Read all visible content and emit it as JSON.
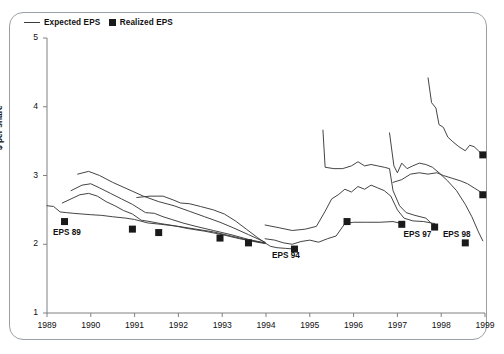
{
  "legend": {
    "items": [
      {
        "label": "Expected EPS",
        "marker": "line"
      },
      {
        "label": "Realized EPS",
        "marker": "square"
      }
    ]
  },
  "chart_data": {
    "type": "line",
    "title": "",
    "xlabel": "",
    "ylabel": "$ per share",
    "xlim": [
      1989,
      1999
    ],
    "ylim": [
      1,
      5
    ],
    "yticks": [
      1,
      2,
      3,
      4,
      5
    ],
    "xticks": [
      1989,
      1990,
      1991,
      1992,
      1993,
      1994,
      1995,
      1996,
      1997,
      1998,
      1999
    ],
    "grid": false,
    "legend_position": "top-left",
    "line_color": "#3a3a3a",
    "marker_color": "#1a1a1a",
    "axis_color": "#808080",
    "annotations": [
      {
        "text": "EPS 89",
        "x": 1989.55,
        "y": 2.15
      },
      {
        "text": "EPS 94",
        "x": 1994.55,
        "y": 1.82
      },
      {
        "text": "EPS 97",
        "x": 1997.55,
        "y": 2.12
      },
      {
        "text": "EPS 98",
        "x": 1998.45,
        "y": 2.12
      }
    ],
    "realized": [
      {
        "name": "EPS 89",
        "x": 1989.4,
        "y": 2.33
      },
      {
        "name": "EPS 90",
        "x": 1990.95,
        "y": 2.22
      },
      {
        "name": "EPS 91",
        "x": 1991.55,
        "y": 2.17
      },
      {
        "name": "EPS 92",
        "x": 1992.95,
        "y": 2.09
      },
      {
        "name": "EPS 93",
        "x": 1993.6,
        "y": 2.02
      },
      {
        "name": "EPS 94",
        "x": 1994.65,
        "y": 1.93
      },
      {
        "name": "EPS 95",
        "x": 1995.85,
        "y": 2.33
      },
      {
        "name": "EPS 96",
        "x": 1997.1,
        "y": 2.29
      },
      {
        "name": "EPS 97",
        "x": 1997.85,
        "y": 2.25
      },
      {
        "name": "EPS 98",
        "x": 1998.55,
        "y": 2.02
      },
      {
        "name": "EPS 99a",
        "x": 1998.95,
        "y": 3.3
      },
      {
        "name": "EPS 99b",
        "x": 1998.95,
        "y": 2.72
      }
    ],
    "series": [
      {
        "name": "Forecast 1989",
        "points": [
          [
            1989.0,
            2.56
          ],
          [
            1989.15,
            2.55
          ],
          [
            1989.3,
            2.47
          ],
          [
            1989.45,
            2.46
          ],
          [
            1989.6,
            2.45
          ],
          [
            1989.8,
            2.44
          ],
          [
            1990.0,
            2.43
          ],
          [
            1990.25,
            2.42
          ],
          [
            1990.5,
            2.4
          ],
          [
            1990.8,
            2.38
          ],
          [
            1991.0,
            2.36
          ],
          [
            1991.3,
            2.31
          ],
          [
            1991.6,
            2.29
          ],
          [
            1992.0,
            2.26
          ],
          [
            1992.4,
            2.22
          ],
          [
            1992.8,
            2.18
          ],
          [
            1993.2,
            2.12
          ],
          [
            1993.6,
            2.06
          ],
          [
            1993.95,
            2.02
          ]
        ]
      },
      {
        "name": "Forecast 1990",
        "points": [
          [
            1989.35,
            2.6
          ],
          [
            1989.55,
            2.66
          ],
          [
            1989.75,
            2.72
          ],
          [
            1989.95,
            2.74
          ],
          [
            1990.15,
            2.7
          ],
          [
            1990.35,
            2.62
          ],
          [
            1990.55,
            2.56
          ],
          [
            1990.75,
            2.49
          ],
          [
            1990.95,
            2.44
          ],
          [
            1991.15,
            2.35
          ],
          [
            1991.35,
            2.33
          ],
          [
            1991.6,
            2.3
          ],
          [
            1991.9,
            2.27
          ],
          [
            1992.2,
            2.23
          ],
          [
            1992.6,
            2.19
          ],
          [
            1993.0,
            2.14
          ],
          [
            1993.4,
            2.08
          ],
          [
            1993.8,
            2.03
          ],
          [
            1993.98,
            2.01
          ]
        ]
      },
      {
        "name": "Forecast 1991",
        "points": [
          [
            1989.55,
            2.78
          ],
          [
            1989.8,
            2.86
          ],
          [
            1990.0,
            2.88
          ],
          [
            1990.2,
            2.82
          ],
          [
            1990.45,
            2.74
          ],
          [
            1990.7,
            2.66
          ],
          [
            1990.95,
            2.58
          ],
          [
            1991.1,
            2.52
          ],
          [
            1991.25,
            2.46
          ],
          [
            1991.45,
            2.45
          ],
          [
            1991.65,
            2.4
          ],
          [
            1991.85,
            2.36
          ],
          [
            1992.1,
            2.31
          ],
          [
            1992.4,
            2.26
          ],
          [
            1992.8,
            2.2
          ],
          [
            1993.2,
            2.14
          ],
          [
            1993.6,
            2.07
          ],
          [
            1993.98,
            2.02
          ]
        ]
      },
      {
        "name": "Forecast 1992",
        "points": [
          [
            1989.7,
            3.02
          ],
          [
            1989.95,
            3.06
          ],
          [
            1990.2,
            3.0
          ],
          [
            1990.5,
            2.9
          ],
          [
            1990.85,
            2.8
          ],
          [
            1991.2,
            2.7
          ],
          [
            1991.55,
            2.62
          ],
          [
            1991.9,
            2.56
          ],
          [
            1992.25,
            2.48
          ],
          [
            1992.6,
            2.4
          ],
          [
            1992.95,
            2.32
          ],
          [
            1993.25,
            2.24
          ],
          [
            1993.6,
            2.14
          ],
          [
            1993.98,
            2.03
          ]
        ]
      },
      {
        "name": "Forecast 1993",
        "points": [
          [
            1991.05,
            2.68
          ],
          [
            1991.35,
            2.7
          ],
          [
            1991.65,
            2.7
          ],
          [
            1991.9,
            2.64
          ],
          [
            1992.05,
            2.6
          ],
          [
            1992.25,
            2.59
          ],
          [
            1992.5,
            2.55
          ],
          [
            1992.8,
            2.5
          ],
          [
            1993.05,
            2.44
          ],
          [
            1993.3,
            2.34
          ],
          [
            1993.55,
            2.22
          ],
          [
            1993.8,
            2.1
          ],
          [
            1993.98,
            2.02
          ]
        ]
      },
      {
        "name": "Forecast 1994",
        "points": [
          [
            1993.98,
            2.02
          ],
          [
            1994.1,
            1.97
          ],
          [
            1994.25,
            1.95
          ],
          [
            1994.45,
            1.94
          ],
          [
            1994.65,
            1.93
          ]
        ]
      },
      {
        "name": "Forecast 1995",
        "points": [
          [
            1993.98,
            2.08
          ],
          [
            1994.2,
            2.06
          ],
          [
            1994.4,
            2.02
          ],
          [
            1994.6,
            2.0
          ],
          [
            1994.8,
            2.04
          ],
          [
            1995.0,
            2.06
          ],
          [
            1995.2,
            2.03
          ],
          [
            1995.4,
            2.08
          ],
          [
            1995.6,
            2.12
          ],
          [
            1995.8,
            2.3
          ],
          [
            1996.0,
            2.32
          ],
          [
            1996.3,
            2.32
          ],
          [
            1996.6,
            2.32
          ],
          [
            1996.9,
            2.33
          ],
          [
            1997.1,
            2.3
          ]
        ]
      },
      {
        "name": "Forecast 1996",
        "points": [
          [
            1993.98,
            2.28
          ],
          [
            1994.3,
            2.24
          ],
          [
            1994.6,
            2.2
          ],
          [
            1994.9,
            2.22
          ],
          [
            1995.15,
            2.26
          ],
          [
            1995.35,
            2.48
          ],
          [
            1995.5,
            2.66
          ],
          [
            1995.65,
            2.72
          ],
          [
            1995.8,
            2.8
          ],
          [
            1995.95,
            2.76
          ],
          [
            1996.1,
            2.84
          ],
          [
            1996.25,
            2.8
          ],
          [
            1996.4,
            2.86
          ],
          [
            1996.55,
            2.82
          ],
          [
            1996.7,
            2.78
          ],
          [
            1996.85,
            2.7
          ],
          [
            1997.0,
            2.5
          ],
          [
            1997.15,
            2.38
          ],
          [
            1997.35,
            2.34
          ],
          [
            1997.6,
            2.33
          ],
          [
            1997.85,
            2.3
          ]
        ]
      },
      {
        "name": "Forecast 1997",
        "points": [
          [
            1995.3,
            3.66
          ],
          [
            1995.35,
            3.12
          ],
          [
            1995.55,
            3.1
          ],
          [
            1995.75,
            3.1
          ],
          [
            1995.95,
            3.14
          ],
          [
            1996.1,
            3.2
          ],
          [
            1996.25,
            3.14
          ],
          [
            1996.4,
            3.16
          ],
          [
            1996.55,
            3.14
          ],
          [
            1996.7,
            3.12
          ],
          [
            1996.82,
            3.1
          ],
          [
            1996.9,
            2.78
          ],
          [
            1997.05,
            2.56
          ],
          [
            1997.2,
            2.46
          ],
          [
            1997.4,
            2.42
          ],
          [
            1997.65,
            2.38
          ],
          [
            1997.85,
            2.26
          ]
        ]
      },
      {
        "name": "Forecast 1998",
        "points": [
          [
            1996.82,
            3.62
          ],
          [
            1996.92,
            3.14
          ],
          [
            1997.0,
            3.04
          ],
          [
            1997.1,
            3.18
          ],
          [
            1997.22,
            3.1
          ],
          [
            1997.35,
            3.14
          ],
          [
            1997.5,
            3.18
          ],
          [
            1997.65,
            3.16
          ],
          [
            1997.8,
            3.12
          ],
          [
            1997.95,
            3.04
          ],
          [
            1998.15,
            2.92
          ],
          [
            1998.35,
            2.78
          ],
          [
            1998.55,
            2.58
          ],
          [
            1998.7,
            2.4
          ],
          [
            1998.85,
            2.18
          ],
          [
            1998.95,
            2.05
          ]
        ]
      },
      {
        "name": "Forecast 1999a",
        "points": [
          [
            1996.9,
            2.9
          ],
          [
            1997.1,
            2.94
          ],
          [
            1997.3,
            3.02
          ],
          [
            1997.5,
            3.04
          ],
          [
            1997.7,
            3.02
          ],
          [
            1997.9,
            3.04
          ],
          [
            1998.05,
            3.0
          ],
          [
            1998.25,
            2.96
          ],
          [
            1998.45,
            2.92
          ],
          [
            1998.6,
            2.88
          ],
          [
            1998.75,
            2.82
          ],
          [
            1998.9,
            2.76
          ],
          [
            1998.95,
            2.72
          ]
        ]
      },
      {
        "name": "Forecast 1999b",
        "points": [
          [
            1997.7,
            4.42
          ],
          [
            1997.78,
            4.06
          ],
          [
            1997.88,
            3.98
          ],
          [
            1997.95,
            3.74
          ],
          [
            1998.05,
            3.7
          ],
          [
            1998.15,
            3.56
          ],
          [
            1998.25,
            3.5
          ],
          [
            1998.4,
            3.42
          ],
          [
            1998.55,
            3.36
          ],
          [
            1998.65,
            3.44
          ],
          [
            1998.75,
            3.42
          ],
          [
            1998.85,
            3.36
          ],
          [
            1998.95,
            3.3
          ]
        ]
      }
    ]
  }
}
